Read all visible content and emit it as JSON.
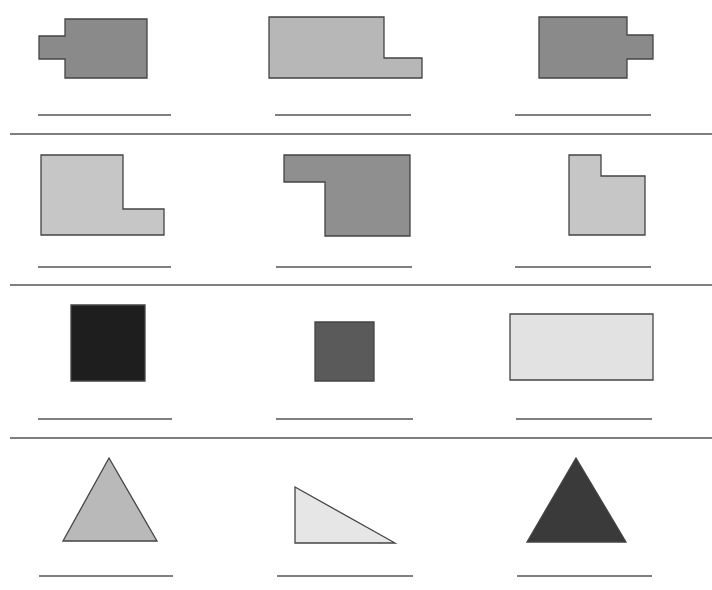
{
  "worksheet": {
    "width": 712,
    "height": 590,
    "stroke_color": "#444444",
    "line_color": "#555555",
    "dividers": [
      {
        "y": 134,
        "x1": 10,
        "x2": 712
      },
      {
        "y": 285,
        "x1": 10,
        "x2": 712
      },
      {
        "y": 438,
        "x1": 10,
        "x2": 712
      }
    ],
    "shapes": [
      {
        "id": "shape-1",
        "kind": "polygon",
        "description": "rectangle with tab on left",
        "fill": "#8a8a8a",
        "points": "65,19 147,19 147,78 65,78 65,59 39,59 39,36 65,36",
        "answer_line": {
          "x1": 38,
          "x2": 171,
          "y": 115
        }
      },
      {
        "id": "shape-2",
        "kind": "polygon",
        "description": "rectangle with step on right",
        "fill": "#b7b7b7",
        "points": "269,17 384,17 384,58 422,58 422,78 269,78",
        "answer_line": {
          "x1": 275,
          "x2": 411,
          "y": 115
        }
      },
      {
        "id": "shape-3",
        "kind": "polygon",
        "description": "rectangle with tab on right",
        "fill": "#8a8a8a",
        "points": "539,17 627,17 627,35 653,35 653,59 627,59 627,78 539,78",
        "answer_line": {
          "x1": 515,
          "x2": 651,
          "y": 115
        }
      },
      {
        "id": "shape-4",
        "kind": "polygon",
        "description": "L-shape notch top right",
        "fill": "#c6c6c6",
        "points": "41,155 123,155 123,209 164,209 164,235 41,235",
        "answer_line": {
          "x1": 38,
          "x2": 171,
          "y": 267
        }
      },
      {
        "id": "shape-5",
        "kind": "polygon",
        "description": "L-shape notch bottom left",
        "fill": "#8f8f8f",
        "points": "284,155 410,155 410,236 325,236 325,182 284,182",
        "answer_line": {
          "x1": 276,
          "x2": 412,
          "y": 267
        }
      },
      {
        "id": "shape-6",
        "kind": "polygon",
        "description": "L-shape notch top right small",
        "fill": "#c6c6c6",
        "points": "569,155 601,155 601,176 645,176 645,235 569,235",
        "answer_line": {
          "x1": 515,
          "x2": 651,
          "y": 267
        }
      },
      {
        "id": "shape-7",
        "kind": "polygon",
        "description": "dark square",
        "fill": "#1e1e1e",
        "points": "71,305 145,305 145,381 71,381",
        "answer_line": {
          "x1": 38,
          "x2": 172,
          "y": 419
        }
      },
      {
        "id": "shape-8",
        "kind": "polygon",
        "description": "medium square",
        "fill": "#5a5a5a",
        "points": "315,322 374,322 374,381 315,381",
        "answer_line": {
          "x1": 276,
          "x2": 413,
          "y": 419
        }
      },
      {
        "id": "shape-9",
        "kind": "polygon",
        "description": "light rectangle",
        "fill": "#e2e2e2",
        "points": "510,314 653,314 653,380 510,380",
        "answer_line": {
          "x1": 516,
          "x2": 652,
          "y": 419
        }
      },
      {
        "id": "shape-10",
        "kind": "polygon",
        "description": "isosceles triangle",
        "fill": "#b9b9b9",
        "points": "109,458 157,541 63,541",
        "answer_line": {
          "x1": 39,
          "x2": 173,
          "y": 576
        }
      },
      {
        "id": "shape-11",
        "kind": "polygon",
        "description": "right triangle",
        "fill": "#e6e6e6",
        "points": "295,487 395,543 295,543",
        "answer_line": {
          "x1": 277,
          "x2": 413,
          "y": 576
        }
      },
      {
        "id": "shape-12",
        "kind": "polygon",
        "description": "dark triangle",
        "fill": "#3a3a3a",
        "points": "576,458 626,542 527,542",
        "answer_line": {
          "x1": 517,
          "x2": 652,
          "y": 576
        }
      }
    ]
  }
}
